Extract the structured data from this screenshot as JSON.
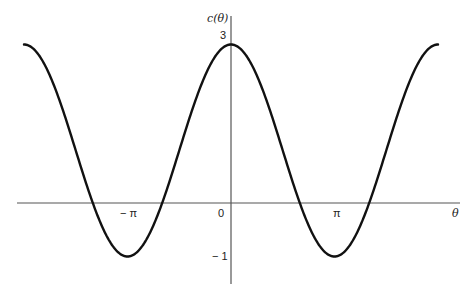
{
  "chart_data": {
    "type": "line",
    "title": "",
    "function": "c(θ) = 1 + 2cos θ",
    "xlabel": "θ",
    "ylabel": "c(θ)",
    "x_range": [
      "-2π",
      "2π"
    ],
    "ylim": [
      -1,
      3
    ],
    "x_ticks": [
      {
        "value": -3.14159,
        "label": "− π"
      },
      {
        "value": 0,
        "label": "0"
      },
      {
        "value": 3.14159,
        "label": "π"
      }
    ],
    "y_ticks": [
      {
        "value": 3,
        "label": "3"
      },
      {
        "value": -1,
        "label": "− 1"
      }
    ],
    "series": [
      {
        "name": "c(θ)",
        "x": [
          -6.2832,
          -4.7124,
          -4.1888,
          -3.1416,
          -2.0944,
          -1.5708,
          0,
          1.5708,
          2.0944,
          3.1416,
          4.1888,
          4.7124,
          6.2832
        ],
        "values": [
          3,
          1,
          0,
          -1,
          0,
          1,
          3,
          1,
          0,
          -1,
          0,
          1,
          3
        ]
      }
    ],
    "grid": false,
    "legend": "none"
  },
  "labels": {
    "y_axis": "c(θ)",
    "y_max": "3",
    "y_min": "− 1",
    "origin": "0",
    "neg_pi": "− π",
    "pi": "π",
    "x_axis": "θ"
  },
  "colors": {
    "curve": "#111111",
    "axis": "#555555"
  }
}
